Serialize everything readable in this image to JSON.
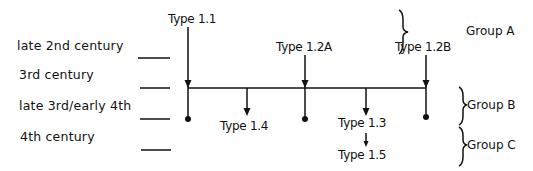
{
  "periods": [
    {
      "label": "late 2nd century"
    },
    {
      "label": "3rd century"
    },
    {
      "label": "late 3rd/early 4th"
    },
    {
      "label": "4th century"
    }
  ],
  "types": {
    "t11": "Type 1.1",
    "t12a": "Type 1.2A",
    "t12b": "Type 1.2B",
    "t13": "Type 1.3",
    "t14": "Type 1.4",
    "t15": "Type 1.5"
  },
  "groups": {
    "a": "Group A",
    "b": "Group B",
    "c": "Group C"
  },
  "colors": {
    "line": "#111111",
    "background": "#ffffff"
  }
}
